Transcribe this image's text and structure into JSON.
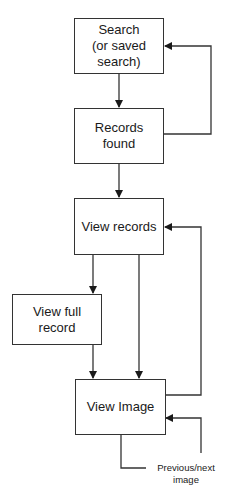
{
  "diagram": {
    "type": "flowchart",
    "nodes": [
      {
        "id": "search",
        "lines": [
          "Search",
          "(or saved",
          "search)"
        ]
      },
      {
        "id": "records_found",
        "lines": [
          "Records",
          "found"
        ]
      },
      {
        "id": "view_records",
        "lines": [
          "View records"
        ]
      },
      {
        "id": "view_full_record",
        "lines": [
          "View full",
          "record"
        ]
      },
      {
        "id": "view_image",
        "lines": [
          "View Image"
        ]
      }
    ],
    "edges": [
      {
        "from": "search",
        "to": "records_found"
      },
      {
        "from": "records_found",
        "to": "search"
      },
      {
        "from": "records_found",
        "to": "view_records"
      },
      {
        "from": "view_records",
        "to": "view_full_record"
      },
      {
        "from": "view_records",
        "to": "view_image"
      },
      {
        "from": "view_full_record",
        "to": "view_image"
      },
      {
        "from": "view_image",
        "to": "view_records"
      },
      {
        "from": "view_image",
        "to": "view_image",
        "label": "Previous/next image"
      }
    ],
    "loop_label": {
      "lines": [
        "Previous/next",
        "image"
      ]
    }
  }
}
